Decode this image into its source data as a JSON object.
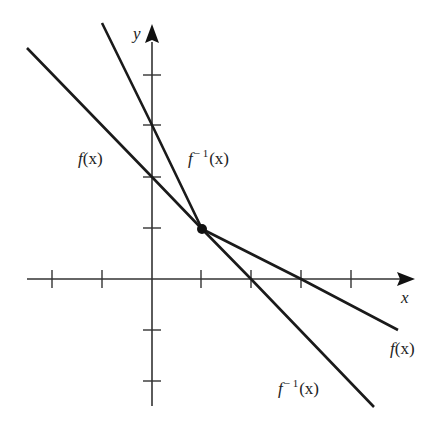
{
  "figure": {
    "type": "graph of a function and its inverse",
    "axes": {
      "x_label": "x",
      "y_label": "y",
      "origin_px": [
        152,
        279
      ],
      "unit_px": 50,
      "x_ticks": [
        -2,
        -1,
        1,
        2,
        3,
        4
      ],
      "y_ticks": [
        -2,
        -1,
        1,
        2,
        3
      ]
    },
    "curves": [
      {
        "name": "f(x)",
        "kind": "line",
        "y_intercept": 2,
        "x_intercept": 3
      },
      {
        "name": "f^{-1}(x)",
        "kind": "line",
        "y_intercept": 3,
        "x_intercept": 2
      }
    ],
    "intersection_point": [
      1,
      1
    ],
    "labels": {
      "f_upper": {
        "base": "f",
        "arg": "(x)"
      },
      "finv_upper": {
        "base": "f",
        "sup": "− 1",
        "arg": "(x)"
      },
      "f_lower": {
        "base": "f",
        "arg": "(x)"
      },
      "finv_lower": {
        "base": "f",
        "sup": "− 1",
        "arg": "(x)"
      }
    },
    "line_color": "#1a1a1a",
    "axis_color": "#333333"
  }
}
